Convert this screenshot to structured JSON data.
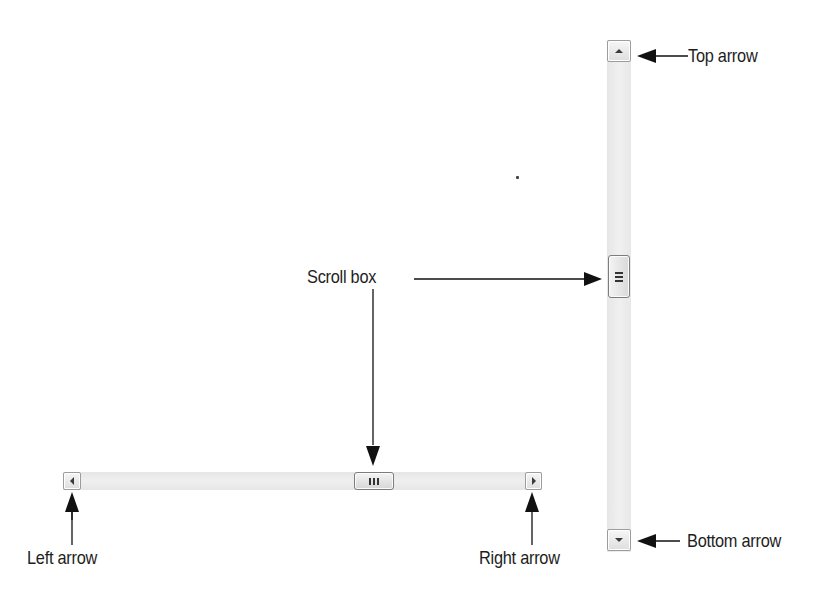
{
  "labels": {
    "top_arrow": "Top arrow",
    "scroll_box": "Scroll box",
    "bottom_arrow": "Bottom arrow",
    "left_arrow": "Left arrow",
    "right_arrow": "Right arrow"
  },
  "icons": {
    "up": "triangle-up",
    "down": "triangle-down",
    "left": "triangle-left",
    "right": "triangle-right",
    "thumb_grip": "grip-lines"
  },
  "colors": {
    "track": "#ebebeb",
    "button_border": "#9c9c9c",
    "thumb_border": "#7c7c7c",
    "arrow_ink": "#111111",
    "text": "#1e1e1e"
  }
}
